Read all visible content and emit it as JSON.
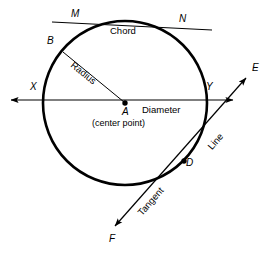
{
  "figure": {
    "type": "geometry-diagram",
    "background_color": "#ffffff",
    "stroke_color": "#000000",
    "circle": {
      "center_x": 125,
      "center_y": 103,
      "radius": 82,
      "stroke_width": 2.6
    },
    "points": [
      {
        "id": "A",
        "label": "A",
        "x": 125,
        "y": 103,
        "marker": "filled-dot",
        "description": "center point"
      },
      {
        "id": "B",
        "label": "B",
        "x": 62,
        "y": 51,
        "marker": "none",
        "description": "point on circle, radius endpoint"
      },
      {
        "id": "D",
        "label": "D",
        "x": 184,
        "y": 161,
        "marker": "filled-dot",
        "description": "point of tangency"
      },
      {
        "id": "M",
        "label": "M",
        "x": 80,
        "y": 24,
        "marker": "none",
        "description": "chord left intersection"
      },
      {
        "id": "N",
        "label": "N",
        "x": 176,
        "y": 29,
        "marker": "none",
        "description": "chord right intersection"
      },
      {
        "id": "X",
        "label": "X",
        "x": 43,
        "y": 100,
        "marker": "none",
        "description": "diameter left endpoint on circle"
      },
      {
        "id": "Y",
        "label": "Y",
        "x": 207,
        "y": 100,
        "marker": "none",
        "description": "diameter right endpoint on circle"
      },
      {
        "id": "E",
        "label": "E",
        "x": 248,
        "y": 76,
        "marker": "arrow",
        "description": "tangent line upper arrow end"
      },
      {
        "id": "F",
        "label": "F",
        "x": 113,
        "y": 228,
        "marker": "arrow",
        "description": "tangent line lower arrow end"
      }
    ],
    "labels": {
      "point_a": "A",
      "point_b": "B",
      "point_d": "D",
      "point_m": "M",
      "point_n": "N",
      "point_x": "X",
      "point_y": "Y",
      "point_e": "E",
      "point_f": "F",
      "chord": "Chord",
      "radius": "Radius",
      "diameter": "Diameter",
      "center_point": "(center point)",
      "line": "Line",
      "tangent": "Tangent"
    },
    "segments": [
      {
        "name": "chord",
        "label": "Chord",
        "from": [
          52,
          22
        ],
        "to": [
          212,
          30
        ],
        "stroke_width": 1,
        "arrows": "none"
      },
      {
        "name": "radius",
        "label": "Radius",
        "from": [
          62,
          51
        ],
        "to": [
          125,
          103
        ],
        "stroke_width": 1,
        "arrows": "none"
      },
      {
        "name": "diameter",
        "label": "Diameter",
        "from": [
          9,
          100
        ],
        "to": [
          235,
          100
        ],
        "stroke_width": 1.2,
        "arrows": "both"
      },
      {
        "name": "tangent",
        "label": "Tangent",
        "from": [
          113,
          228
        ],
        "to": [
          248,
          76
        ],
        "stroke_width": 1.2,
        "arrows": "both"
      }
    ]
  }
}
